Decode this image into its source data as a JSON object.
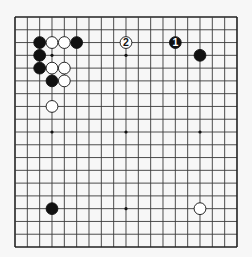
{
  "board": {
    "size": 19,
    "origin_x": 15,
    "origin_y": 17,
    "spacing_x": 12.333,
    "spacing_y": 12.778,
    "background": "#f7f7f7",
    "line_color": "#3a3a3a",
    "frame_color": "#222222",
    "star_points": [
      [
        3,
        3
      ],
      [
        9,
        3
      ],
      [
        15,
        3
      ],
      [
        3,
        9
      ],
      [
        9,
        9
      ],
      [
        15,
        9
      ],
      [
        3,
        15
      ],
      [
        9,
        15
      ],
      [
        15,
        15
      ]
    ]
  },
  "stones": [
    {
      "color": "black",
      "col": 2,
      "row": 2
    },
    {
      "color": "white",
      "col": 3,
      "row": 2
    },
    {
      "color": "white",
      "col": 4,
      "row": 2
    },
    {
      "color": "black",
      "col": 5,
      "row": 2
    },
    {
      "color": "black",
      "col": 2,
      "row": 3
    },
    {
      "color": "black",
      "col": 2,
      "row": 4
    },
    {
      "color": "white",
      "col": 3,
      "row": 4
    },
    {
      "color": "white",
      "col": 4,
      "row": 4
    },
    {
      "color": "black",
      "col": 3,
      "row": 5
    },
    {
      "color": "white",
      "col": 4,
      "row": 5
    },
    {
      "color": "white",
      "col": 3,
      "row": 7
    },
    {
      "color": "white",
      "col": 9,
      "row": 2,
      "label": "2"
    },
    {
      "color": "black",
      "col": 13,
      "row": 2,
      "label": "1"
    },
    {
      "color": "black",
      "col": 15,
      "row": 3
    },
    {
      "color": "black",
      "col": 3,
      "row": 15
    },
    {
      "color": "white",
      "col": 15,
      "row": 15
    }
  ]
}
